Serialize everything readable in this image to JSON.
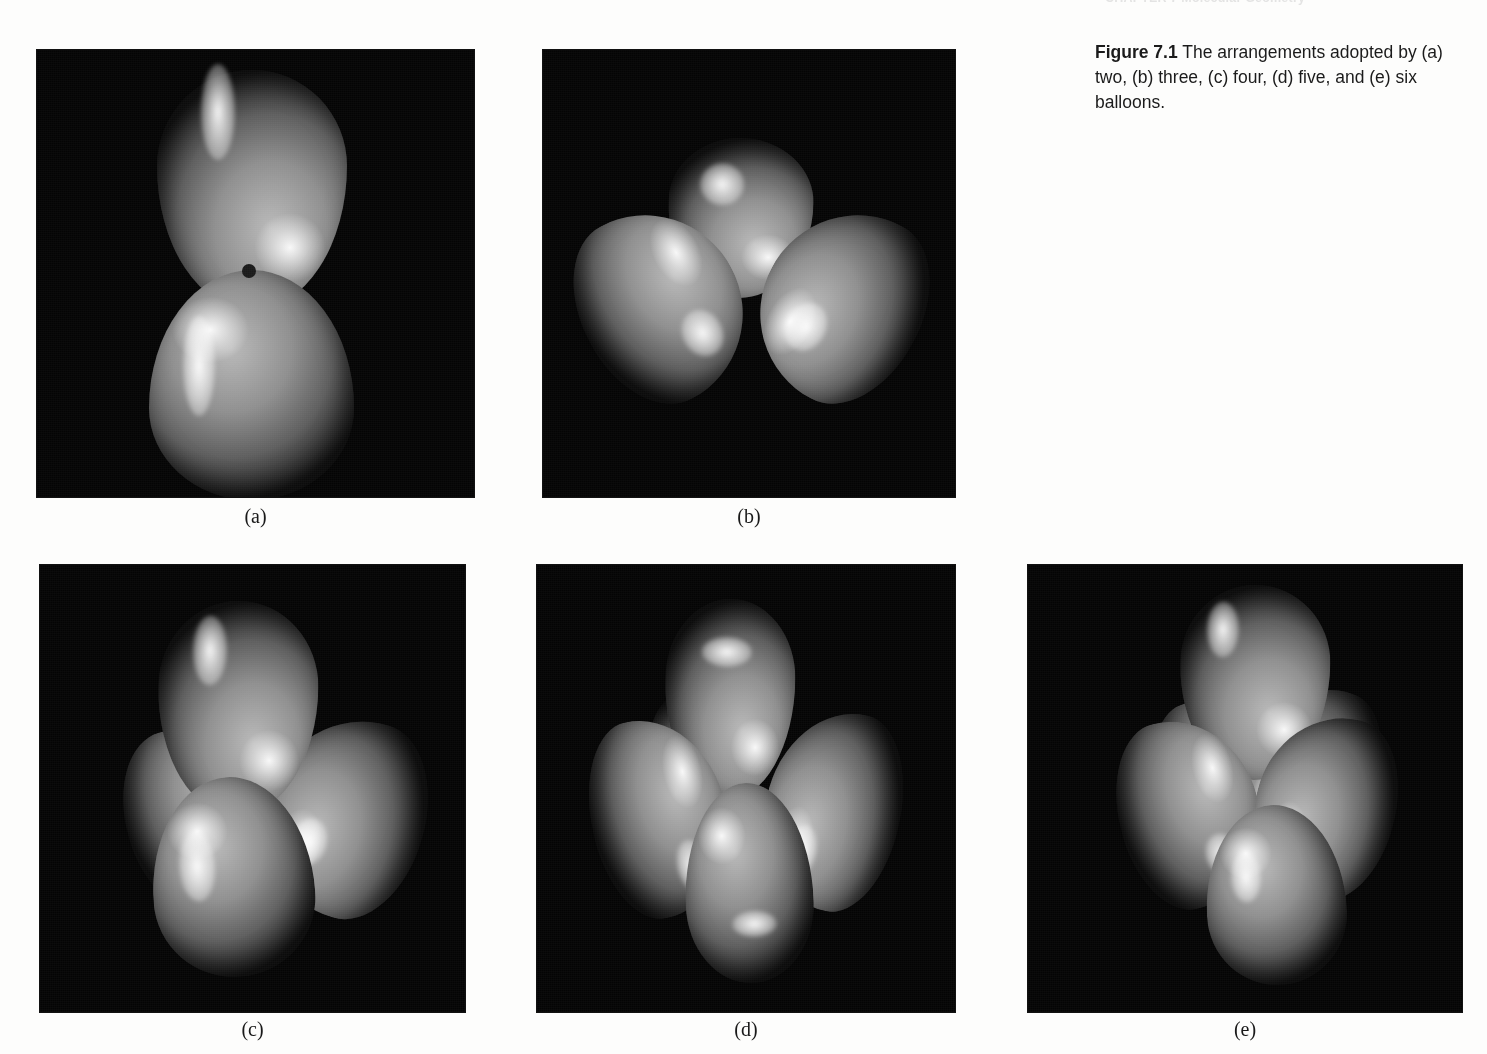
{
  "page": {
    "background_color": "#fdfdfc",
    "running_head": "CHAPTER 7  Molecular Geometry",
    "panel_background_color": "#040404"
  },
  "figure": {
    "number_label": "Figure 7.1",
    "caption_text": " The arrangements adopted by (a) two, (b) three, (c) four, (d) five, and (e) six balloons."
  },
  "panels": [
    {
      "letter": "(a)",
      "balloon_count": 2,
      "arrangement": "linear",
      "angle_deg": 180
    },
    {
      "letter": "(b)",
      "balloon_count": 3,
      "arrangement": "trigonal planar",
      "angle_deg": 120
    },
    {
      "letter": "(c)",
      "balloon_count": 4,
      "arrangement": "tetrahedral",
      "angle_deg": 109.5
    },
    {
      "letter": "(d)",
      "balloon_count": 5,
      "arrangement": "trigonal bipyramidal",
      "angle_deg": 120
    },
    {
      "letter": "(e)",
      "balloon_count": 6,
      "arrangement": "octahedral",
      "angle_deg": 90
    }
  ]
}
